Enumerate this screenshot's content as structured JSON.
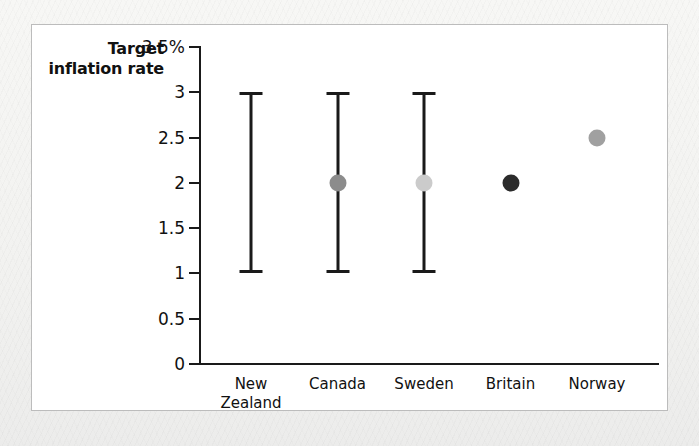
{
  "figure": {
    "title": "Target\ninflation\nrate"
  },
  "chart_data": {
    "type": "scatter",
    "title": "Target inflation rate",
    "xlabel": "",
    "ylabel": "Target inflation rate",
    "ylim": [
      0,
      3.5
    ],
    "yticks": [
      0,
      0.5,
      1,
      1.5,
      2,
      2.5,
      3,
      3.5
    ],
    "ytick_labels": [
      "0",
      "0.5",
      "1",
      "1.5",
      "2",
      "2.5",
      "3",
      "3.5%"
    ],
    "grid": false,
    "legend": "none",
    "categories": [
      "New Zealand",
      "Canada",
      "Sweden",
      "Britain",
      "Norway"
    ],
    "category_label_lines": [
      [
        "New",
        "Zealand"
      ],
      [
        "Canada"
      ],
      [
        "Sweden"
      ],
      [
        "Britain"
      ],
      [
        "Norway"
      ]
    ],
    "series": [
      {
        "name": "Target range",
        "type": "range",
        "values": [
          {
            "category": "New Zealand",
            "low": 1,
            "high": 3
          },
          {
            "category": "Canada",
            "low": 1,
            "high": 3
          },
          {
            "category": "Sweden",
            "low": 1,
            "high": 3
          },
          {
            "category": "Britain",
            "low": null,
            "high": null
          },
          {
            "category": "Norway",
            "low": null,
            "high": null
          }
        ]
      },
      {
        "name": "Target point",
        "type": "point",
        "values": [
          {
            "category": "New Zealand",
            "value": null,
            "color": null
          },
          {
            "category": "Canada",
            "value": 2,
            "color": "#8c8c8c"
          },
          {
            "category": "Sweden",
            "value": 2,
            "color": "#cbcbcb"
          },
          {
            "category": "Britain",
            "value": 2,
            "color": "#2b2b2b"
          },
          {
            "category": "Norway",
            "value": 2.5,
            "color": "#a0a0a0"
          }
        ]
      }
    ],
    "colors": {
      "axis": "#1a1a1a",
      "panel": "#ffffff",
      "panel_border": "#bcbcbc",
      "page_background": "#f4f4f2",
      "dot_canada": "#8c8c8c",
      "dot_sweden": "#cbcbcb",
      "dot_britain": "#2b2b2b",
      "dot_norway": "#a0a0a0"
    }
  }
}
